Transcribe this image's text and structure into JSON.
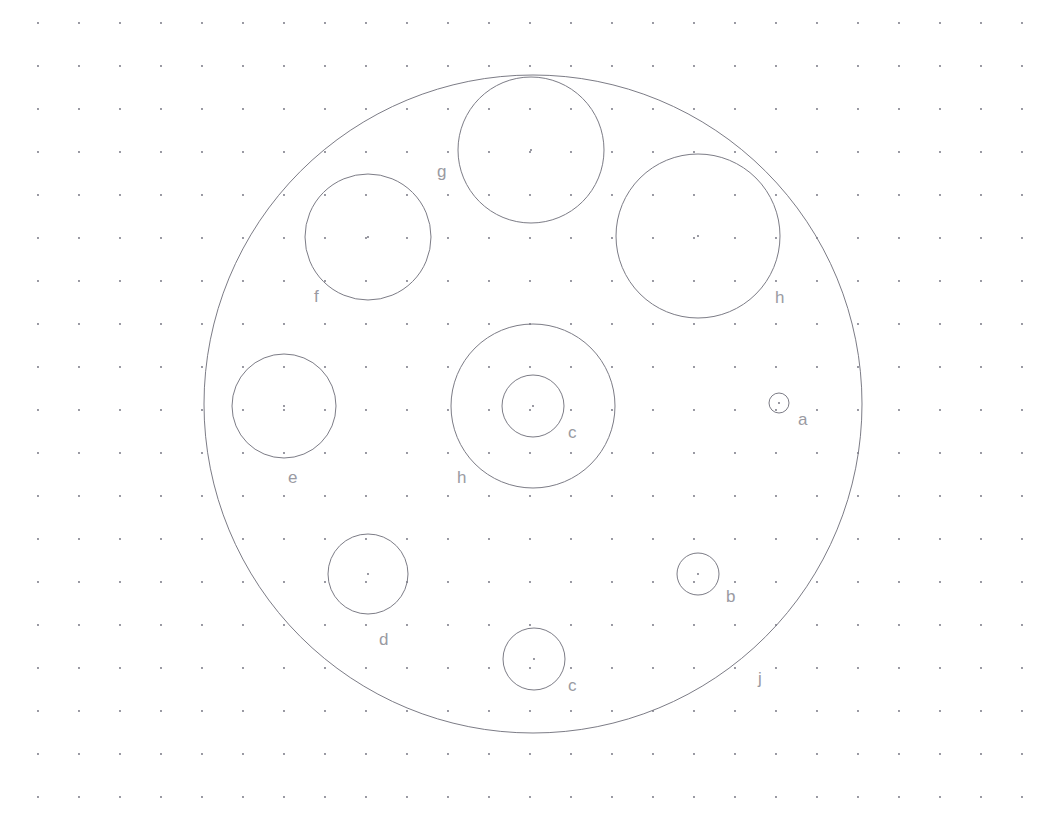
{
  "drawing": {
    "title": "Circular plate hole pattern drawing",
    "background_color": "#ffffff",
    "line_color": "#7c7c86",
    "label_color": "#9a9aa2",
    "grid_dot_color": "#6a6a78",
    "canvas": {
      "width": 1050,
      "height": 815
    },
    "grid": {
      "origin_x": 38,
      "origin_y": 23,
      "spacing_x": 41,
      "spacing_y": 43,
      "dot_radius": 0.9
    },
    "outer_boundary": {
      "label": "j",
      "cx": 533,
      "cy": 404,
      "r": 329,
      "label_x": 758,
      "label_y": 684
    },
    "holes": [
      {
        "label": "a",
        "cx": 779,
        "cy": 403,
        "r": 10,
        "label_x": 798,
        "label_y": 425,
        "center_mark": true
      },
      {
        "label": "b",
        "cx": 698,
        "cy": 574,
        "r": 21,
        "label_x": 726,
        "label_y": 602,
        "center_mark": true
      },
      {
        "label": "c",
        "cx": 534,
        "cy": 659,
        "r": 31,
        "label_x": 568,
        "label_y": 691,
        "center_mark": true
      },
      {
        "label": "d",
        "cx": 368,
        "cy": 574,
        "r": 40,
        "label_x": 379,
        "label_y": 645,
        "center_mark": true
      },
      {
        "label": "e",
        "cx": 284,
        "cy": 406,
        "r": 52,
        "label_x": 288,
        "label_y": 483,
        "center_mark": true
      },
      {
        "label": "f",
        "cx": 368,
        "cy": 237,
        "r": 63,
        "label_x": 314,
        "label_y": 302,
        "center_mark": true
      },
      {
        "label": "g",
        "cx": 531,
        "cy": 150,
        "r": 73,
        "label_x": 437,
        "label_y": 177,
        "center_mark": true
      },
      {
        "label": "h",
        "cx": 698,
        "cy": 236,
        "r": 82,
        "label_x": 775,
        "label_y": 303,
        "center_mark": true
      },
      {
        "label": "h",
        "cx": 533,
        "cy": 406,
        "r": 82,
        "label_x": 457,
        "label_y": 483,
        "center_mark": false
      },
      {
        "label": "c",
        "cx": 533,
        "cy": 406,
        "r": 31,
        "label_x": 568,
        "label_y": 438,
        "center_mark": true
      }
    ]
  }
}
